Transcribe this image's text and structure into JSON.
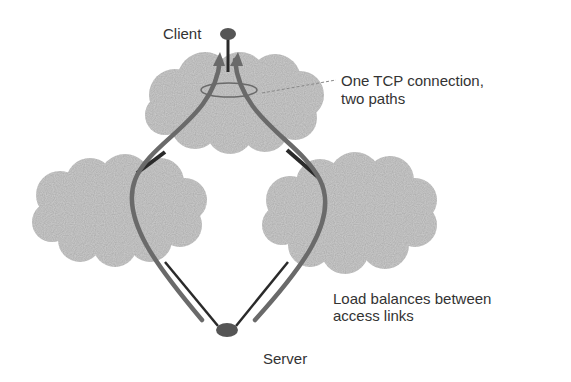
{
  "diagram": {
    "colors": {
      "cloud": "#cfcfcf",
      "path": "#6a6a6a",
      "link": "#2a2a2a",
      "node": "#555555",
      "text": "#333333"
    },
    "nodes": {
      "client": {
        "label": "Client"
      },
      "server": {
        "label": "Server"
      }
    },
    "clouds": [
      "top-network",
      "left-network",
      "right-network"
    ],
    "annotations": {
      "tcp_line1": "One TCP connection,",
      "tcp_line2": "two paths",
      "lb_line1": "Load balances between",
      "lb_line2": "access links"
    }
  }
}
